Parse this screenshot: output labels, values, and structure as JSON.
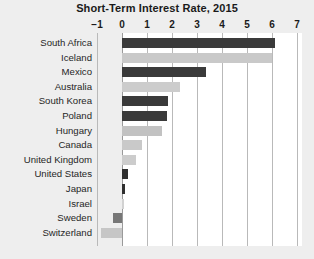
{
  "chart_data": {
    "type": "bar",
    "orientation": "horizontal",
    "title": "Short-Term Interest Rate, 2015",
    "xlabel": "",
    "ylabel": "",
    "xlim": [
      -1,
      7
    ],
    "xticks": [
      -1,
      0,
      1,
      2,
      3,
      4,
      5,
      6,
      7
    ],
    "xtick_labels": [
      "−1",
      "0",
      "1",
      "2",
      "3",
      "4",
      "5",
      "6",
      "7"
    ],
    "grid": true,
    "legend": "none",
    "categories": [
      "South Africa",
      "Iceland",
      "Mexico",
      "Australia",
      "South Korea",
      "Poland",
      "Hungary",
      "Canada",
      "United Kingdom",
      "United States",
      "Japan",
      "Israel",
      "Sweden",
      "Switzerland"
    ],
    "values": [
      6.1,
      6.0,
      3.35,
      2.3,
      1.85,
      1.8,
      1.6,
      0.78,
      0.55,
      0.25,
      0.1,
      0.08,
      -0.35,
      -0.85
    ],
    "bar_colors": [
      "#3a3a3a",
      "#c9c9c9",
      "#3a3a3a",
      "#cccccc",
      "#3a3a3a",
      "#3a3a3a",
      "#c2c2c2",
      "#c9c9c9",
      "#cccccc",
      "#2f2f2f",
      "#2f2f2f",
      "#d2d2d2",
      "#777777",
      "#c6c6c6"
    ],
    "colors": {
      "dark_bar": "#3a3a3a",
      "light_bar": "#c9c9c9",
      "plot_background": "#ffffff",
      "figure_background": "#eeeeee",
      "gridline": "#b9b9b9",
      "text": "#1a1a1a"
    }
  }
}
